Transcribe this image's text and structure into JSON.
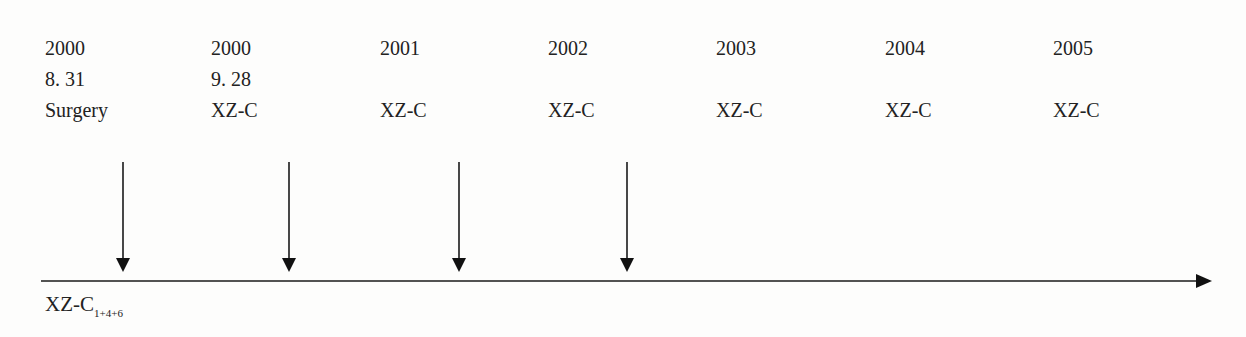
{
  "timeline": {
    "columns": [
      {
        "year": "2000",
        "date": "8. 31",
        "event": "Surgery",
        "x": 45
      },
      {
        "year": "2000",
        "date": "9. 28",
        "event": "XZ-C",
        "x": 211
      },
      {
        "year": "2001",
        "date": "",
        "event": "XZ-C",
        "x": 380
      },
      {
        "year": "2002",
        "date": "",
        "event": "XZ-C",
        "x": 548
      },
      {
        "year": "2003",
        "date": "",
        "event": "XZ-C",
        "x": 716
      },
      {
        "year": "2004",
        "date": "",
        "event": "XZ-C",
        "x": 885
      },
      {
        "year": "2005",
        "date": "",
        "event": "XZ-C",
        "x": 1053
      }
    ],
    "arrows_x": [
      123,
      289,
      459,
      627
    ],
    "axis_label_main": "XZ-C",
    "axis_label_sub": "1+4+6",
    "line_color": "#1a1a1a"
  }
}
